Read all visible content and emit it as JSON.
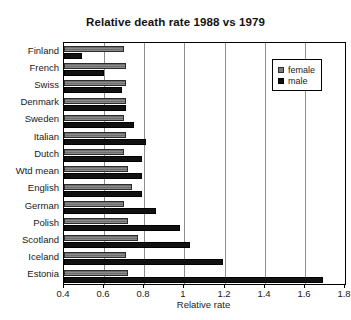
{
  "chart_data": {
    "type": "bar",
    "orientation": "horizontal",
    "title": "Relative death rate 1988 vs 1979",
    "xlabel": "Relative rate",
    "ylabel": "",
    "xlim": [
      0.4,
      1.8
    ],
    "xticks": [
      0.4,
      0.6,
      0.8,
      1,
      1.2,
      1.4,
      1.6,
      1.8
    ],
    "xtick_labels": [
      "0.4",
      "0.6",
      "0.8",
      "1",
      "1.2",
      "1.4",
      "1.6",
      "1.8"
    ],
    "grid": true,
    "legend_position": "top-right",
    "categories": [
      "Finland",
      "French",
      "Swiss",
      "Denmark",
      "Sweden",
      "Italian",
      "Dutch",
      "Wtd mean",
      "English",
      "German",
      "Polish",
      "Scotland",
      "Iceland",
      "Estonia"
    ],
    "series": [
      {
        "name": "female",
        "color": "#7a7a7a",
        "values": [
          0.7,
          0.71,
          0.71,
          0.71,
          0.7,
          0.71,
          0.7,
          0.72,
          0.74,
          0.7,
          0.72,
          0.77,
          0.71,
          0.72
        ]
      },
      {
        "name": "male",
        "color": "#111111",
        "values": [
          0.49,
          0.6,
          0.69,
          0.71,
          0.75,
          0.81,
          0.79,
          0.79,
          0.79,
          0.86,
          0.98,
          1.03,
          1.19,
          1.69
        ]
      }
    ]
  },
  "legend": {
    "items": [
      {
        "label": "female",
        "swatch": "female"
      },
      {
        "label": "male",
        "swatch": "male"
      }
    ]
  }
}
